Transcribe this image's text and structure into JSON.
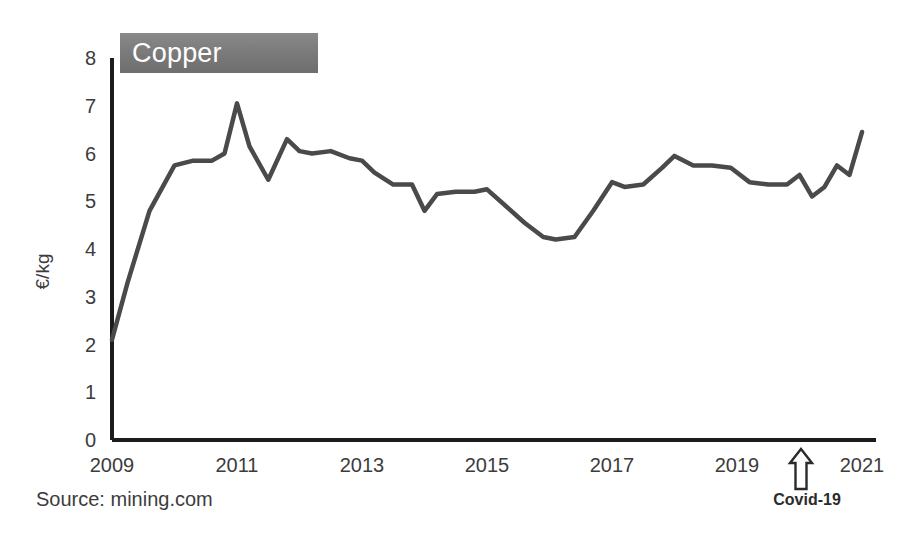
{
  "badge": {
    "label": "Copper"
  },
  "axes": {
    "y_title": "€/kg",
    "y_ticks": [
      "8",
      "7",
      "6",
      "5",
      "4",
      "3",
      "2",
      "1",
      "0"
    ],
    "x_ticks": [
      "2009",
      "2011",
      "2013",
      "2015",
      "2017",
      "2019",
      "2021"
    ]
  },
  "annotations": {
    "covid_label": "Covid-19",
    "covid_arrow_icon": "arrow-up-outline-icon"
  },
  "source": {
    "text": "Source: mining.com"
  },
  "colors": {
    "line": "#4a4a4a",
    "axis": "#1c1c1c",
    "badge_bg": "#7b7b7b",
    "badge_text": "#ffffff",
    "background": "#ffffff",
    "tick_text": "#3c3c3c"
  },
  "chart_data": {
    "type": "line",
    "title": "Copper",
    "xlabel": "",
    "ylabel": "€/kg",
    "xlim": [
      2009.0,
      2021.0
    ],
    "ylim": [
      0,
      8
    ],
    "grid": false,
    "legend": "none",
    "x_tick_values": [
      2009,
      2011,
      2013,
      2015,
      2017,
      2019,
      2021
    ],
    "y_tick_values": [
      0,
      1,
      2,
      3,
      4,
      5,
      6,
      7,
      8
    ],
    "series": [
      {
        "name": "Copper price",
        "unit": "€/kg",
        "x": [
          2009.0,
          2009.25,
          2009.6,
          2010.0,
          2010.3,
          2010.6,
          2010.8,
          2011.0,
          2011.2,
          2011.5,
          2011.8,
          2012.0,
          2012.2,
          2012.5,
          2012.8,
          2013.0,
          2013.2,
          2013.5,
          2013.8,
          2014.0,
          2014.2,
          2014.5,
          2014.8,
          2015.0,
          2015.3,
          2015.6,
          2015.9,
          2016.1,
          2016.4,
          2016.7,
          2017.0,
          2017.2,
          2017.5,
          2017.8,
          2018.0,
          2018.3,
          2018.6,
          2018.9,
          2019.2,
          2019.5,
          2019.8,
          2020.0,
          2020.2,
          2020.4,
          2020.6,
          2020.8,
          2021.0
        ],
        "y": [
          2.1,
          3.3,
          4.8,
          5.75,
          5.85,
          5.85,
          6.0,
          7.05,
          6.15,
          5.45,
          6.3,
          6.05,
          6.0,
          6.05,
          5.9,
          5.85,
          5.6,
          5.35,
          5.35,
          4.8,
          5.15,
          5.2,
          5.2,
          5.25,
          4.9,
          4.55,
          4.25,
          4.2,
          4.25,
          4.8,
          5.4,
          5.3,
          5.35,
          5.7,
          5.95,
          5.75,
          5.75,
          5.7,
          5.4,
          5.35,
          5.35,
          5.55,
          5.1,
          5.3,
          5.75,
          5.55,
          6.45
        ]
      }
    ],
    "annotations": [
      {
        "text": "Covid-19",
        "x": 2020.0,
        "marker": "arrow-up"
      }
    ],
    "source": "Source: mining.com"
  }
}
